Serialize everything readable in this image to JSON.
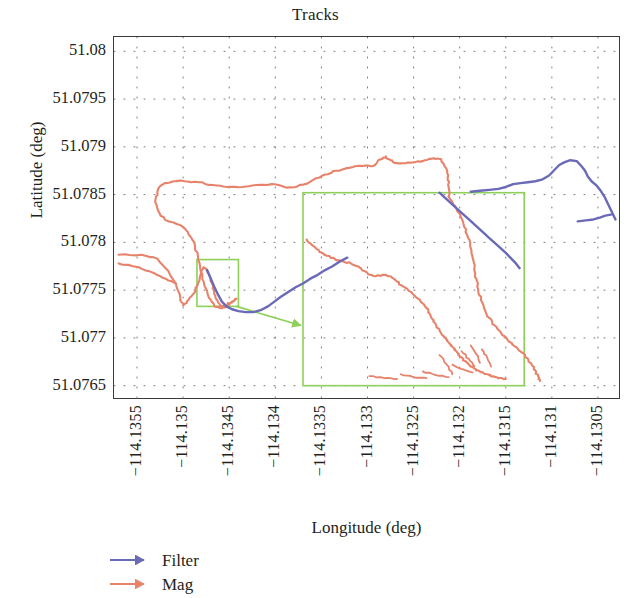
{
  "figure": {
    "title": "Tracks",
    "background": "#ffffff",
    "frame_color": "#3b3b3b"
  },
  "axes": {
    "xlabel": "Longitude (deg)",
    "ylabel": "Latitude (deg)",
    "xticks": [
      "−114.1355",
      "−114.135",
      "−114.1345",
      "−114.134",
      "−114.1335",
      "−114.133",
      "−114.1325",
      "−114.132",
      "−114.1315",
      "−114.131",
      "−114.1305"
    ],
    "yticks": [
      "51.08",
      "51.0795",
      "51.079",
      "51.0785",
      "51.078",
      "51.0775",
      "51.077",
      "51.0765"
    ]
  },
  "legend": {
    "items": [
      {
        "label": "Filter",
        "color": "#6a6ab8"
      },
      {
        "label": "Mag",
        "color": "#e8836b"
      }
    ]
  },
  "annotations": {
    "zoom_box_color": "#8ed05a",
    "small_box": {
      "x0": -114.13485,
      "x1": -114.1344,
      "y0": 51.07733,
      "y1": 51.07782
    },
    "large_box": {
      "x0": -114.1337,
      "x1": -114.1313,
      "y0": 51.0765,
      "y1": 51.07852
    },
    "arrow_color": "#8ed05a"
  },
  "chart_data": {
    "type": "line",
    "title": "Tracks",
    "xlabel": "Longitude (deg)",
    "ylabel": "Latitude (deg)",
    "xlim": [
      -114.13575,
      -114.13025
    ],
    "ylim": [
      51.07635,
      51.08015
    ],
    "xtick_values": [
      -114.1355,
      -114.135,
      -114.1345,
      -114.134,
      -114.1335,
      -114.133,
      -114.1325,
      -114.132,
      -114.1315,
      -114.131,
      -114.1305
    ],
    "ytick_values": [
      51.08,
      51.0795,
      51.079,
      51.0785,
      51.078,
      51.0775,
      51.077,
      51.0765
    ],
    "grid": "dotted",
    "legend_position": "below-left",
    "series": [
      {
        "name": "Mag",
        "color": "#e8836b",
        "points": [
          [
            -114.1357,
            51.07787
          ],
          [
            -114.13545,
            51.07787
          ],
          [
            -114.13528,
            51.07783
          ],
          [
            -114.13516,
            51.0777
          ],
          [
            -114.13508,
            51.07757
          ],
          [
            -114.13503,
            51.07742
          ],
          [
            -114.135,
            51.07734
          ],
          [
            -114.13494,
            51.0774
          ],
          [
            -114.13488,
            51.07747
          ],
          [
            -114.13484,
            51.07757
          ],
          [
            -114.13481,
            51.07766
          ],
          [
            -114.13478,
            51.07774
          ],
          [
            -114.13474,
            51.07771
          ],
          [
            -114.1347,
            51.07762
          ],
          [
            -114.13468,
            51.07752
          ],
          [
            -114.13465,
            51.07744
          ],
          [
            -114.13462,
            51.07737
          ],
          [
            -114.13458,
            51.07733
          ],
          [
            -114.13452,
            51.07735
          ],
          [
            -114.13447,
            51.07738
          ],
          [
            -114.13442,
            51.07741
          ],
          [
            -114.13447,
            51.07737
          ],
          [
            -114.13452,
            51.07733
          ],
          [
            -114.13458,
            51.07731
          ],
          [
            -114.13466,
            51.07733
          ],
          [
            -114.13472,
            51.07742
          ],
          [
            -114.13477,
            51.07755
          ],
          [
            -114.13481,
            51.0777
          ],
          [
            -114.13484,
            51.07785
          ],
          [
            -114.13488,
            51.078
          ],
          [
            -114.13495,
            51.07811
          ],
          [
            -114.13503,
            51.07818
          ],
          [
            -114.13512,
            51.07821
          ],
          [
            -114.1352,
            51.07824
          ],
          [
            -114.13527,
            51.07833
          ],
          [
            -114.1353,
            51.07845
          ],
          [
            -114.13527,
            51.07856
          ],
          [
            -114.1352,
            51.07862
          ],
          [
            -114.1351,
            51.07864
          ],
          [
            -114.13498,
            51.07864
          ],
          [
            -114.13483,
            51.07863
          ],
          [
            -114.13468,
            51.0786
          ],
          [
            -114.13452,
            51.07858
          ],
          [
            -114.13436,
            51.07858
          ],
          [
            -114.1342,
            51.0786
          ],
          [
            -114.13404,
            51.07861
          ],
          [
            -114.1339,
            51.07858
          ],
          [
            -114.13378,
            51.07858
          ],
          [
            -114.13368,
            51.07861
          ],
          [
            -114.13358,
            51.07866
          ],
          [
            -114.13346,
            51.07871
          ],
          [
            -114.13334,
            51.07875
          ],
          [
            -114.1332,
            51.07878
          ],
          [
            -114.13306,
            51.0788
          ],
          [
            -114.13294,
            51.0788
          ],
          [
            -114.13286,
            51.07887
          ],
          [
            -114.1328,
            51.0789
          ],
          [
            -114.13275,
            51.07886
          ],
          [
            -114.13268,
            51.07883
          ],
          [
            -114.13258,
            51.07883
          ],
          [
            -114.13248,
            51.07884
          ],
          [
            -114.13238,
            51.07886
          ],
          [
            -114.13228,
            51.07888
          ],
          [
            -114.1322,
            51.07887
          ],
          [
            -114.13215,
            51.07878
          ],
          [
            -114.13213,
            51.07868
          ],
          [
            -114.13212,
            51.07858
          ],
          [
            -114.13212,
            51.07848
          ]
        ]
      },
      {
        "name": "Mag-branch-2",
        "color": "#e8836b",
        "points": [
          [
            -114.1357,
            51.07778
          ],
          [
            -114.13548,
            51.07774
          ],
          [
            -114.13532,
            51.07768
          ],
          [
            -114.13519,
            51.07762
          ],
          [
            -114.13508,
            51.07757
          ]
        ]
      },
      {
        "name": "Mag-centre",
        "color": "#e8836b",
        "points": [
          [
            -114.13366,
            51.07803
          ],
          [
            -114.1336,
            51.07797
          ],
          [
            -114.13352,
            51.0779
          ],
          [
            -114.13344,
            51.07786
          ],
          [
            -114.13335,
            51.07782
          ],
          [
            -114.13326,
            51.0778
          ],
          [
            -114.13318,
            51.07778
          ],
          [
            -114.1331,
            51.07775
          ],
          [
            -114.13303,
            51.0777
          ],
          [
            -114.13297,
            51.07766
          ],
          [
            -114.1329,
            51.07765
          ],
          [
            -114.13282,
            51.07766
          ],
          [
            -114.13274,
            51.07764
          ],
          [
            -114.13268,
            51.07759
          ],
          [
            -114.13262,
            51.07754
          ],
          [
            -114.13256,
            51.0775
          ],
          [
            -114.1325,
            51.07745
          ],
          [
            -114.13245,
            51.07741
          ],
          [
            -114.1324,
            51.07736
          ],
          [
            -114.13236,
            51.07731
          ],
          [
            -114.13233,
            51.07726
          ],
          [
            -114.1323,
            51.0772
          ],
          [
            -114.13226,
            51.07714
          ],
          [
            -114.13222,
            51.07709
          ],
          [
            -114.13219,
            51.07703
          ],
          [
            -114.13215,
            51.07699
          ],
          [
            -114.13211,
            51.07694
          ],
          [
            -114.13207,
            51.0769
          ],
          [
            -114.13203,
            51.07685
          ],
          [
            -114.13199,
            51.0768
          ],
          [
            -114.13195,
            51.07676
          ],
          [
            -114.1319,
            51.07672
          ],
          [
            -114.13185,
            51.07669
          ],
          [
            -114.1318,
            51.07666
          ],
          [
            -114.13174,
            51.07663
          ],
          [
            -114.13168,
            51.07661
          ],
          [
            -114.13162,
            51.07659
          ],
          [
            -114.13156,
            51.07658
          ],
          [
            -114.1315,
            51.07657
          ]
        ]
      },
      {
        "name": "Mag-right-loop",
        "color": "#e8836b",
        "points": [
          [
            -114.13212,
            51.07848
          ],
          [
            -114.13205,
            51.07838
          ],
          [
            -114.13199,
            51.07827
          ],
          [
            -114.13195,
            51.07816
          ],
          [
            -114.13191,
            51.07805
          ],
          [
            -114.13188,
            51.07794
          ],
          [
            -114.13186,
            51.07784
          ],
          [
            -114.13184,
            51.07773
          ],
          [
            -114.13182,
            51.07762
          ],
          [
            -114.1318,
            51.07751
          ],
          [
            -114.13177,
            51.0774
          ],
          [
            -114.13173,
            51.0773
          ],
          [
            -114.13168,
            51.07721
          ],
          [
            -114.13162,
            51.07713
          ],
          [
            -114.13155,
            51.07705
          ],
          [
            -114.13148,
            51.07698
          ],
          [
            -114.1314,
            51.07691
          ],
          [
            -114.13133,
            51.07685
          ],
          [
            -114.13127,
            51.07679
          ],
          [
            -114.13122,
            51.07672
          ],
          [
            -114.13118,
            51.07666
          ],
          [
            -114.13115,
            51.0766
          ],
          [
            -114.13113,
            51.07655
          ]
        ]
      },
      {
        "name": "Filter",
        "color": "#6a6ab8",
        "points": [
          [
            -114.13474,
            51.07771
          ],
          [
            -114.1347,
            51.07762
          ],
          [
            -114.13466,
            51.07753
          ],
          [
            -114.13462,
            51.07745
          ],
          [
            -114.13458,
            51.07738
          ],
          [
            -114.13453,
            51.07733
          ],
          [
            -114.13447,
            51.0773
          ],
          [
            -114.1344,
            51.07728
          ],
          [
            -114.13432,
            51.07727
          ],
          [
            -114.13424,
            51.07727
          ],
          [
            -114.13416,
            51.07729
          ],
          [
            -114.13408,
            51.07733
          ],
          [
            -114.13401,
            51.07738
          ],
          [
            -114.13394,
            51.07743
          ],
          [
            -114.13386,
            51.07748
          ],
          [
            -114.13378,
            51.07753
          ],
          [
            -114.1337,
            51.07757
          ],
          [
            -114.13362,
            51.07762
          ],
          [
            -114.13354,
            51.07766
          ],
          [
            -114.13346,
            51.07771
          ],
          [
            -114.13338,
            51.07775
          ],
          [
            -114.1333,
            51.0778
          ],
          [
            -114.13322,
            51.07784
          ]
        ]
      },
      {
        "name": "Filter-diagonal",
        "color": "#6a6ab8",
        "points": [
          [
            -114.13222,
            51.07852
          ],
          [
            -114.13214,
            51.07845
          ],
          [
            -114.13206,
            51.07838
          ],
          [
            -114.13198,
            51.07831
          ],
          [
            -114.1319,
            51.07824
          ],
          [
            -114.13182,
            51.07817
          ],
          [
            -114.13174,
            51.0781
          ],
          [
            -114.13166,
            51.07803
          ],
          [
            -114.13158,
            51.07796
          ],
          [
            -114.1315,
            51.07789
          ],
          [
            -114.13144,
            51.07783
          ],
          [
            -114.13139,
            51.07778
          ],
          [
            -114.13135,
            51.07773
          ]
        ]
      },
      {
        "name": "Filter-top-right",
        "color": "#6a6ab8",
        "points": [
          [
            -114.13188,
            51.07853
          ],
          [
            -114.13178,
            51.07854
          ],
          [
            -114.13168,
            51.07855
          ],
          [
            -114.13158,
            51.07856
          ],
          [
            -114.1315,
            51.07858
          ],
          [
            -114.13142,
            51.07861
          ],
          [
            -114.13134,
            51.07862
          ],
          [
            -114.13126,
            51.07863
          ],
          [
            -114.13118,
            51.07864
          ],
          [
            -114.1311,
            51.07866
          ],
          [
            -114.13103,
            51.0787
          ],
          [
            -114.13097,
            51.07876
          ],
          [
            -114.13092,
            51.07881
          ],
          [
            -114.13086,
            51.07884
          ],
          [
            -114.1308,
            51.07886
          ],
          [
            -114.13073,
            51.07885
          ],
          [
            -114.13068,
            51.0788
          ],
          [
            -114.13064,
            51.07875
          ],
          [
            -114.13061,
            51.07869
          ],
          [
            -114.13057,
            51.07864
          ],
          [
            -114.13052,
            51.0786
          ],
          [
            -114.13047,
            51.07854
          ],
          [
            -114.13043,
            51.07848
          ],
          [
            -114.1304,
            51.07842
          ],
          [
            -114.13037,
            51.07836
          ],
          [
            -114.13034,
            51.0783
          ],
          [
            -114.13031,
            51.07824
          ]
        ]
      },
      {
        "name": "Filter-lower-right-stub",
        "color": "#6a6ab8",
        "points": [
          [
            -114.13072,
            51.07822
          ],
          [
            -114.13063,
            51.07823
          ],
          [
            -114.13055,
            51.07824
          ],
          [
            -114.13048,
            51.07826
          ],
          [
            -114.13042,
            51.07828
          ],
          [
            -114.13036,
            51.07829
          ]
        ]
      }
    ]
  }
}
